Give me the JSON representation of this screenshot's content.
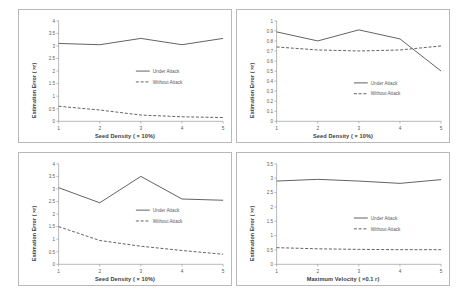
{
  "figure": {
    "panel_count": 4,
    "background": "#ffffff",
    "series_colors": {
      "under_attack": "#595959",
      "without_attack": "#595959"
    }
  },
  "legend": {
    "under_attack": "Under Attack",
    "without_attack": "Without Attack"
  },
  "chart_data": [
    {
      "type": "line",
      "title": "",
      "xlabel": "Seed Density ( × 10%)",
      "ylabel": "Estimation Error ( ×r)",
      "x": [
        1,
        2,
        3,
        4,
        5
      ],
      "xticklabels": [
        "1",
        "2",
        "3",
        "4",
        "5"
      ],
      "ylim": [
        0,
        4
      ],
      "yticks": [
        0,
        0.5,
        1,
        1.5,
        2,
        2.5,
        3,
        3.5,
        4
      ],
      "yticklabels": [
        "0",
        "0.5",
        "1",
        "1.5",
        "2",
        "2.5",
        "3",
        "3.5",
        "4"
      ],
      "grid": false,
      "legend_position": "center-right",
      "series": [
        {
          "name": "Under Attack",
          "style": "solid",
          "values": [
            3.1,
            3.05,
            3.3,
            3.05,
            3.3
          ]
        },
        {
          "name": "Without Attack",
          "style": "dashed",
          "values": [
            0.6,
            0.45,
            0.25,
            0.18,
            0.15
          ]
        }
      ]
    },
    {
      "type": "line",
      "title": "",
      "xlabel": "Seed Density ( × 10%)",
      "ylabel": "Estimation Error ( ×r)",
      "x": [
        1,
        2,
        3,
        4,
        5
      ],
      "xticklabels": [
        "1",
        "2",
        "3",
        "4",
        "5"
      ],
      "ylim": [
        0,
        1
      ],
      "yticks": [
        0,
        0.1,
        0.2,
        0.3,
        0.4,
        0.5,
        0.6,
        0.7,
        0.8,
        0.9,
        1
      ],
      "yticklabels": [
        "0",
        "0.1",
        "0.2",
        "0.3",
        "0.4",
        "0.5",
        "0.6",
        "0.7",
        "0.8",
        "0.9",
        "1"
      ],
      "grid": false,
      "legend_position": "center-right",
      "series": [
        {
          "name": "Under Attack",
          "style": "solid",
          "values": [
            0.89,
            0.8,
            0.91,
            0.82,
            0.5
          ]
        },
        {
          "name": "Without Attack",
          "style": "dashed",
          "values": [
            0.74,
            0.71,
            0.7,
            0.71,
            0.75
          ]
        }
      ]
    },
    {
      "type": "line",
      "title": "",
      "xlabel": "Seed Density ( × 10%)",
      "ylabel": "Estimation Error ( ×r)",
      "x": [
        1,
        2,
        3,
        4,
        5
      ],
      "xticklabels": [
        "1",
        "2",
        "3",
        "4",
        "5"
      ],
      "ylim": [
        0,
        4
      ],
      "yticks": [
        0,
        0.5,
        1,
        1.5,
        2,
        2.5,
        3,
        3.5,
        4
      ],
      "yticklabels": [
        "0",
        "0.5",
        "1",
        "1.5",
        "2",
        "2.5",
        "3",
        "3.5",
        "4"
      ],
      "grid": false,
      "legend_position": "center-right",
      "series": [
        {
          "name": "Under Attack",
          "style": "solid",
          "values": [
            3.05,
            2.45,
            3.5,
            2.6,
            2.55
          ]
        },
        {
          "name": "Without Attack",
          "style": "dashed",
          "values": [
            1.5,
            0.95,
            0.72,
            0.55,
            0.4
          ]
        }
      ]
    },
    {
      "type": "line",
      "title": "",
      "xlabel": "Maximum Velocity ( ×0.1 r)",
      "ylabel": "Estimation Error ( ×r)",
      "x": [
        1,
        2,
        3,
        4,
        5
      ],
      "xticklabels": [
        "1",
        "2",
        "3",
        "4",
        "5"
      ],
      "ylim": [
        0,
        3.5
      ],
      "yticks": [
        0,
        0.5,
        1,
        1.5,
        2,
        2.5,
        3,
        3.5
      ],
      "yticklabels": [
        "0",
        "0.5",
        "1",
        "1.5",
        "2",
        "2.5",
        "3",
        "3.5"
      ],
      "grid": false,
      "legend_position": "center-right",
      "series": [
        {
          "name": "Under Attack",
          "style": "solid",
          "values": [
            2.9,
            2.96,
            2.9,
            2.82,
            2.95
          ]
        },
        {
          "name": "Without Attack",
          "style": "dashed",
          "values": [
            0.58,
            0.54,
            0.52,
            0.51,
            0.51
          ]
        }
      ]
    }
  ]
}
